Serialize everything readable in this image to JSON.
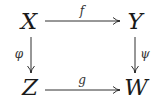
{
  "diagram": {
    "type": "commutative-square",
    "nodes": {
      "top_left": "X",
      "top_right": "Y",
      "bottom_left": "Z",
      "bottom_right": "W"
    },
    "arrows": {
      "top": {
        "label": "f",
        "from": "X",
        "to": "Y"
      },
      "bottom": {
        "label": "g",
        "from": "Z",
        "to": "W"
      },
      "left": {
        "label": "φ",
        "from": "X",
        "to": "Z"
      },
      "right": {
        "label": "ψ",
        "from": "Y",
        "to": "W"
      }
    },
    "color": "#1a1a1a"
  }
}
